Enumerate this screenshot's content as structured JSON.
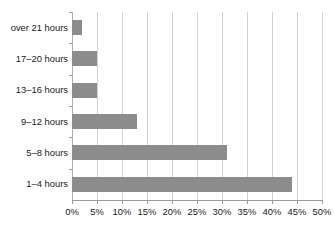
{
  "chart_data": {
    "type": "bar",
    "orientation": "horizontal",
    "title": "",
    "xlabel": "",
    "ylabel": "",
    "categories": [
      "1–4 hours",
      "5–8 hours",
      "9–12 hours",
      "13–16 hours",
      "17–20 hours",
      "over 21 hours"
    ],
    "values": [
      44,
      31,
      13,
      5,
      5,
      2
    ],
    "value_unit": "%",
    "xlim": [
      0,
      50
    ],
    "xticks": [
      0,
      5,
      10,
      15,
      20,
      25,
      30,
      35,
      40,
      45,
      50
    ],
    "xtick_labels": [
      "0%",
      "5%",
      "10%",
      "15%",
      "20%",
      "25%",
      "30%",
      "35%",
      "40%",
      "45%",
      "50%"
    ],
    "grid": "vertical",
    "legend": "none",
    "series": [
      {
        "name": "share",
        "values": [
          44,
          31,
          13,
          5,
          5,
          2
        ]
      }
    ],
    "colors": {
      "bar_fill": "#8c8c8c",
      "gridline": "#d2d2d2",
      "axis": "#9a9a9a",
      "text": "#1a1a1a",
      "background": "#ffffff"
    }
  }
}
